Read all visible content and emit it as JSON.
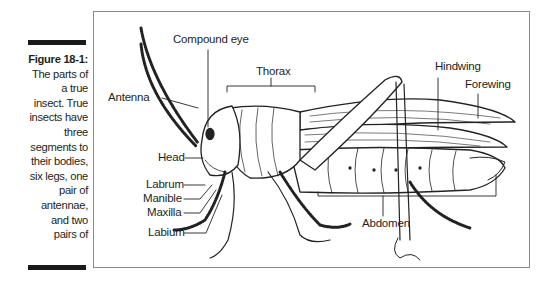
{
  "caption": {
    "title": "Figure 18-1:",
    "lines": [
      "The parts of",
      "a true",
      "insect. True",
      "insects have",
      "three",
      "segments to",
      "their bodies,",
      "six legs, one",
      "pair of",
      "antennae,",
      "and two",
      "pairs of",
      "wings."
    ]
  },
  "diagram": {
    "labels": {
      "compound_eye": "Compound eye",
      "thorax": "Thorax",
      "antenna": "Antenna",
      "head": "Head",
      "labrum": "Labrum",
      "manible": "Manible",
      "maxilla": "Maxilla",
      "labium": "Labium",
      "hindwing": "Hindwing",
      "forewing": "Forewing",
      "abdomen": "Abdomen"
    }
  }
}
